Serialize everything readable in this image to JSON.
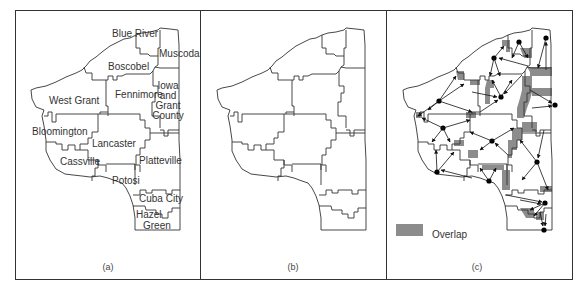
{
  "figure": {
    "panels": [
      {
        "id": "a",
        "caption": "(a)",
        "regions": [
          {
            "name": "Blue River",
            "label": [
              "Blue River"
            ]
          },
          {
            "name": "Muscoda",
            "label": [
              "Muscoda"
            ]
          },
          {
            "name": "Boscobel",
            "label": [
              "Boscobel"
            ]
          },
          {
            "name": "Fennimore",
            "label": [
              "Fennimore"
            ]
          },
          {
            "name": "Iowa and Grant County",
            "label": [
              "Iowa",
              "and",
              "Grant",
              "County"
            ]
          },
          {
            "name": "West Grant",
            "label": [
              "West Grant"
            ]
          },
          {
            "name": "Bloomington",
            "label": [
              "Bloomington"
            ]
          },
          {
            "name": "Lancaster",
            "label": [
              "Lancaster"
            ]
          },
          {
            "name": "Cassville",
            "label": [
              "Cassville"
            ]
          },
          {
            "name": "Platteville",
            "label": [
              "Platteville"
            ]
          },
          {
            "name": "Potosi",
            "label": [
              "Potosi"
            ]
          },
          {
            "name": "Cuba City",
            "label": [
              "Cuba City"
            ]
          },
          {
            "name": "Hazel Green",
            "label": [
              "Hazel",
              "Green"
            ]
          }
        ]
      },
      {
        "id": "b",
        "caption": "(b)"
      },
      {
        "id": "c",
        "caption": "(c)",
        "legend": {
          "swatch_color": "#8c8c8c",
          "label": "Overlap"
        }
      }
    ],
    "colors": {
      "line": "#333333",
      "overlap": "#8c8c8c",
      "dot": "#000000",
      "background": "#ffffff"
    }
  }
}
